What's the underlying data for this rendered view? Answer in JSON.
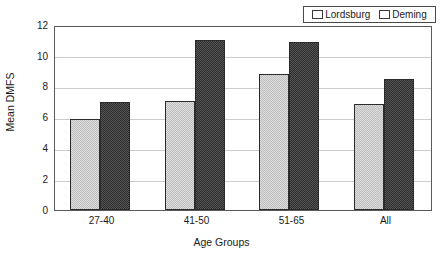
{
  "chart_data": {
    "type": "bar",
    "title": "",
    "xlabel": "Age Groups",
    "ylabel": "Mean DMFS",
    "categories": [
      "27-40",
      "41-50",
      "51-65",
      "All"
    ],
    "series": [
      {
        "name": "Lordsburg",
        "values": [
          5.9,
          7.1,
          8.8,
          6.9
        ],
        "color": "#dcdcdc"
      },
      {
        "name": "Deming",
        "values": [
          7.0,
          11.0,
          10.9,
          8.5
        ],
        "color": "#2e2e2e"
      }
    ],
    "ylim": [
      0,
      12
    ],
    "ytick_step": 2,
    "yticks": [
      "12",
      "10",
      "8",
      "6",
      "4",
      "2",
      "0"
    ],
    "grid": true,
    "legend_position": "top-right"
  },
  "legend": {
    "entries": [
      {
        "label": "Lordsburg",
        "swatch": "light-gray-hatch"
      },
      {
        "label": "Deming",
        "swatch": "black-hatch"
      }
    ]
  }
}
